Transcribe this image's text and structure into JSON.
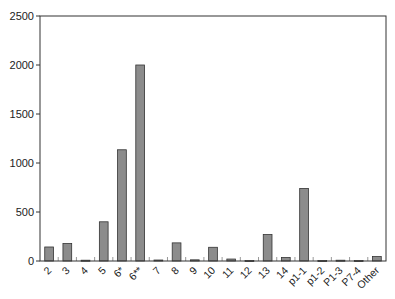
{
  "chart_data": {
    "type": "bar",
    "title": "",
    "xlabel": "",
    "ylabel": "",
    "ylim": [
      0,
      2500
    ],
    "yticks": [
      0,
      500,
      1000,
      1500,
      2000,
      2500
    ],
    "ytick_labels": [
      "0",
      "500",
      "1000",
      "1500",
      "2000",
      "2500"
    ],
    "categories": [
      "2",
      "3",
      "4",
      "5",
      "6*",
      "6**",
      "7",
      "8",
      "9",
      "10",
      "11",
      "12",
      "13",
      "14",
      "p1-1",
      "p1-2",
      "P1-3",
      "P7-4",
      "Other"
    ],
    "values": [
      143,
      178,
      8,
      400,
      1135,
      2000,
      10,
      185,
      12,
      140,
      20,
      5,
      270,
      35,
      740,
      5,
      8,
      5,
      45
    ],
    "grid": false,
    "legend": "none",
    "bar_color": "#8c8c8c"
  }
}
